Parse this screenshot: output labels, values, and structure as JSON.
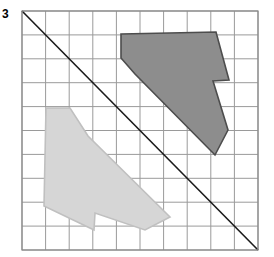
{
  "exercise": {
    "number": "3"
  },
  "figure": {
    "type": "reflection-diagram",
    "grid": {
      "columns": 10,
      "rows": 10,
      "x": 22,
      "y": 11,
      "width": 236,
      "height": 239,
      "line_color": "#9a9a9a",
      "border_color": "#8a8a8a",
      "line_width": 1
    },
    "mirror_line": {
      "name": "line-of-reflection",
      "x1": 22,
      "y1": 11,
      "x2": 258,
      "y2": 250,
      "color": "#1a1a1a",
      "width": 1.6
    },
    "shapes": [
      {
        "name": "dark-polygon",
        "role": "pre-image",
        "fill": "#8d8d8d",
        "stroke": "#4d4d4d",
        "stroke_width": 1.6,
        "points": "121,34 216,32 229,80 213,81 228,130 215,155 135,74 121,58"
      },
      {
        "name": "light-polygon",
        "role": "reflected-image",
        "fill": "#d6d6d6",
        "stroke": "#c0c0c0",
        "stroke_width": 1.6,
        "points": "46,108 44,206 94,230 95,213 145,230 170,217 88,136 70,108"
      }
    ]
  },
  "colors": {
    "page_background": "#ffffff",
    "grid_line": "#9a9a9a",
    "mirror_line": "#1a1a1a",
    "dark_fill": "#8d8d8d",
    "dark_stroke": "#4d4d4d",
    "light_fill": "#d6d6d6",
    "light_stroke": "#c0c0c0",
    "label_text": "#000000"
  },
  "chart_data": {
    "type": "scatter",
    "title": "",
    "xlabel": "",
    "ylabel": "",
    "grid": true,
    "xlim": [
      0,
      10
    ],
    "ylim": [
      0,
      10
    ],
    "annotations": [
      "3"
    ],
    "series": [
      {
        "name": "line-of-reflection",
        "x": [
          0,
          10
        ],
        "y": [
          10,
          0
        ]
      },
      {
        "name": "dark-polygon-vertices",
        "x": [
          4.19,
          8.22,
          8.77,
          8.09,
          8.73,
          8.18,
          4.79,
          4.19
        ],
        "y": [
          9.04,
          9.12,
          7.11,
          7.07,
          5.02,
          3.98,
          7.36,
          8.03
        ]
      },
      {
        "name": "light-polygon-vertices",
        "x": [
          1.02,
          0.93,
          3.05,
          3.09,
          5.21,
          6.27,
          2.8,
          2.03
        ],
        "y": [
          5.94,
          1.84,
          0.84,
          1.55,
          0.84,
          1.38,
          4.77,
          5.94
        ]
      }
    ]
  }
}
